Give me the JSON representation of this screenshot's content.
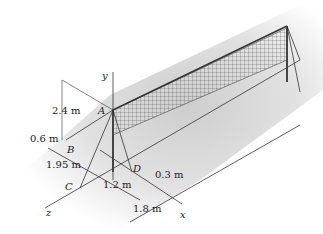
{
  "figure": {
    "points": {
      "A": "A",
      "B": "B",
      "C": "C",
      "D": "D"
    },
    "axes": {
      "x": "x",
      "y": "y",
      "z": "z"
    },
    "dimensions": {
      "height_A": "2.4 m",
      "offset_B": "0.6 m",
      "dist_BC": "1.95 m",
      "dist_CD": "1.2 m",
      "offset_D": "0.3 m",
      "dist_x": "1.8 m"
    },
    "colors": {
      "line": "#333333",
      "ground": "#d9d9d9",
      "net": "#555555"
    }
  }
}
